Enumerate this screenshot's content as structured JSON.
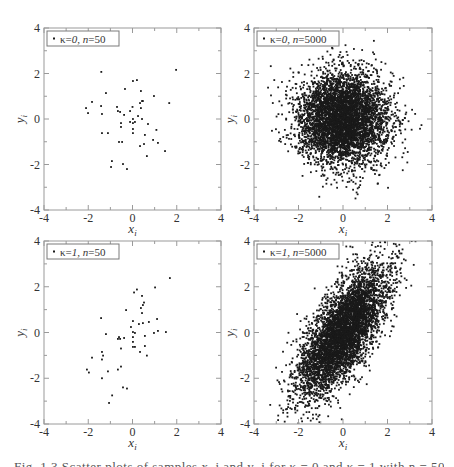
{
  "figure": {
    "caption": "Fig. 1.3 Scatter plots of samples x_i and y_i for κ = 0 and κ = 1 with n = 50 and n = 5000"
  },
  "chart_data": [
    {
      "id": "panel-tl",
      "type": "scatter",
      "legend": "κ=0, n=50",
      "kappa": 0,
      "n": 50,
      "xlabel": "x_i",
      "ylabel": "y_i",
      "xlim": [
        -4,
        4
      ],
      "ylim": [
        -4,
        4
      ],
      "xticks": [
        -4,
        -2,
        0,
        2,
        4
      ],
      "yticks": [
        -4,
        -2,
        0,
        2,
        4
      ],
      "grid": false,
      "legend_position": "upper left",
      "points": [
        [
          -1.41,
          2.07
        ],
        [
          1.97,
          2.16
        ],
        [
          0.02,
          1.67
        ],
        [
          0.2,
          1.71
        ],
        [
          -1.2,
          1.14
        ],
        [
          -0.34,
          1.32
        ],
        [
          0.38,
          1.23
        ],
        [
          -1.83,
          0.75
        ],
        [
          0.97,
          1.01
        ],
        [
          0.47,
          0.79
        ],
        [
          0.43,
          0.79
        ],
        [
          0.34,
          0.7
        ],
        [
          1.66,
          0.7
        ],
        [
          -2.1,
          0.48
        ],
        [
          -1.42,
          0.57
        ],
        [
          -0.7,
          0.53
        ],
        [
          0.0,
          0.53
        ],
        [
          0.38,
          0.48
        ],
        [
          -2.01,
          0.26
        ],
        [
          -1.38,
          0.22
        ],
        [
          -0.66,
          0.35
        ],
        [
          -0.56,
          0.31
        ],
        [
          -0.38,
          0.18
        ],
        [
          -0.11,
          0.35
        ],
        [
          0.25,
          0.13
        ],
        [
          0.02,
          0.0
        ],
        [
          0.43,
          0.0
        ],
        [
          -0.11,
          -0.13
        ],
        [
          0.11,
          -0.13
        ],
        [
          0.02,
          -0.18
        ],
        [
          -0.52,
          -0.18
        ],
        [
          0.7,
          -0.22
        ],
        [
          0.02,
          -0.44
        ],
        [
          -0.52,
          -0.35
        ],
        [
          1.08,
          -0.48
        ],
        [
          0.02,
          -0.62
        ],
        [
          0.56,
          -0.7
        ],
        [
          -1.38,
          -0.62
        ],
        [
          -1.11,
          -0.62
        ],
        [
          -0.61,
          -1.01
        ],
        [
          -0.47,
          -1.01
        ],
        [
          0.93,
          -0.92
        ],
        [
          1.15,
          -1.05
        ],
        [
          0.52,
          -1.1
        ],
        [
          0.34,
          -1.19
        ],
        [
          1.47,
          -1.41
        ],
        [
          0.65,
          -1.63
        ],
        [
          -0.93,
          -1.85
        ],
        [
          -0.97,
          -2.11
        ],
        [
          -0.43,
          -1.98
        ],
        [
          -0.25,
          -2.2
        ]
      ]
    },
    {
      "id": "panel-tr",
      "type": "scatter",
      "legend": "κ=0, n=5000",
      "kappa": 0,
      "n": 5000,
      "xlabel": "x_i",
      "ylabel": "y_i",
      "xlim": [
        -4,
        4
      ],
      "ylim": [
        -4,
        4
      ],
      "xticks": [
        -4,
        -2,
        0,
        2,
        4
      ],
      "yticks": [
        -4,
        -2,
        0,
        2,
        4
      ],
      "grid": false,
      "legend_position": "upper left",
      "distribution": {
        "mean": [
          0,
          0
        ],
        "std": [
          1,
          1
        ],
        "correlation": 0.0,
        "seed": 12345
      }
    },
    {
      "id": "panel-bl",
      "type": "scatter",
      "legend": "κ=1, n=50",
      "kappa": 1,
      "n": 50,
      "xlabel": "x_i",
      "ylabel": "y_i",
      "xlim": [
        -4,
        4
      ],
      "ylim": [
        -4,
        4
      ],
      "xticks": [
        -4,
        -2,
        0,
        2,
        4
      ],
      "yticks": [
        -4,
        -2,
        0,
        2,
        4
      ],
      "grid": false,
      "legend_position": "upper left",
      "points": [
        [
          1.69,
          2.38
        ],
        [
          1.02,
          1.97
        ],
        [
          0.2,
          1.88
        ],
        [
          0.07,
          1.75
        ],
        [
          0.43,
          1.6
        ],
        [
          0.52,
          1.31
        ],
        [
          0.47,
          1.2
        ],
        [
          0.38,
          1.07
        ],
        [
          -0.29,
          0.98
        ],
        [
          0.43,
          0.85
        ],
        [
          -1.42,
          0.63
        ],
        [
          1.11,
          0.59
        ],
        [
          0.02,
          0.5
        ],
        [
          0.29,
          0.37
        ],
        [
          0.47,
          0.41
        ],
        [
          0.74,
          0.46
        ],
        [
          -0.07,
          0.24
        ],
        [
          1.15,
          0.07
        ],
        [
          1.51,
          0.02
        ],
        [
          0.02,
          0.02
        ],
        [
          0.11,
          -0.02
        ],
        [
          0.97,
          -0.02
        ],
        [
          -1.2,
          -0.07
        ],
        [
          -0.61,
          -0.2
        ],
        [
          -0.66,
          -0.28
        ],
        [
          -0.56,
          -0.28
        ],
        [
          -0.38,
          -0.24
        ],
        [
          0.02,
          -0.2
        ],
        [
          0.02,
          -0.41
        ],
        [
          0.56,
          -0.15
        ],
        [
          -1.38,
          -0.85
        ],
        [
          0.02,
          -0.63
        ],
        [
          0.56,
          -0.59
        ],
        [
          -0.52,
          -0.7
        ],
        [
          0.34,
          -0.85
        ],
        [
          0.65,
          -1.01
        ],
        [
          -1.83,
          -1.1
        ],
        [
          -1.38,
          -1.18
        ],
        [
          -0.52,
          -1.49
        ],
        [
          -0.66,
          -1.62
        ],
        [
          -2.06,
          -1.62
        ],
        [
          -1.97,
          -1.75
        ],
        [
          -1.11,
          -1.7
        ],
        [
          -1.38,
          -2.0
        ],
        [
          -0.43,
          -2.4
        ],
        [
          -0.25,
          -2.45
        ],
        [
          -0.92,
          -2.75
        ],
        [
          -1.06,
          -3.08
        ],
        [
          -1.33,
          -1.01
        ],
        [
          0.11,
          -0.63
        ]
      ]
    },
    {
      "id": "panel-br",
      "type": "scatter",
      "legend": "κ=1, n=5000",
      "kappa": 1,
      "n": 5000,
      "xlabel": "x_i",
      "ylabel": "y_i",
      "xlim": [
        -4,
        4
      ],
      "ylim": [
        -4,
        4
      ],
      "xticks": [
        -4,
        -2,
        0,
        2,
        4
      ],
      "yticks": [
        -4,
        -2,
        0,
        2,
        4
      ],
      "grid": false,
      "legend_position": "upper left",
      "distribution": {
        "mean": [
          0,
          0
        ],
        "std": [
          1,
          1.41
        ],
        "correlation": 0.71,
        "seed": 67890
      }
    }
  ],
  "layout": {
    "panels": [
      {
        "id": "panel-tl",
        "left": 44,
        "top": 28,
        "right": 221,
        "bottom": 210
      },
      {
        "id": "panel-tr",
        "left": 254,
        "top": 28,
        "right": 432,
        "bottom": 210
      },
      {
        "id": "panel-bl",
        "left": 44,
        "top": 241,
        "right": 221,
        "bottom": 424
      },
      {
        "id": "panel-br",
        "left": 254,
        "top": 241,
        "right": 432,
        "bottom": 424
      }
    ],
    "colors": {
      "axis": "#9a9a9a",
      "text": "#333333",
      "points": "#1a1a1a",
      "legend_border": "#7a7a7a"
    }
  }
}
